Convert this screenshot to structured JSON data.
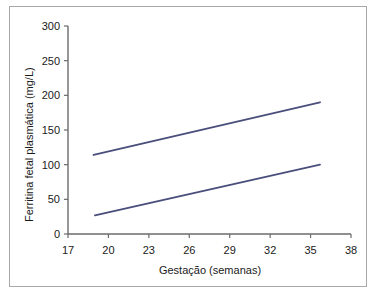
{
  "chart_data": {
    "type": "line",
    "title": "",
    "xlabel": "Gestação (semanas)",
    "ylabel": "Ferritina fetal plasmática (mg/L)",
    "xlim": [
      17,
      38
    ],
    "ylim": [
      0,
      300
    ],
    "xticks": [
      17,
      20,
      23,
      26,
      29,
      32,
      35,
      38
    ],
    "xtick_labels": [
      "17",
      "20",
      "23",
      "26",
      "29",
      "32",
      "35",
      "38"
    ],
    "yticks": [
      0,
      50,
      100,
      150,
      200,
      250,
      300
    ],
    "ytick_labels": [
      "0",
      "50",
      "100",
      "150",
      "200",
      "250",
      "300"
    ],
    "grid": false,
    "legend": false,
    "legend_position": "none",
    "line_color": "#4a4e7c",
    "axis_color": "#6b6b6b",
    "frame_color": "#a8a8a8",
    "background": "#ffffff",
    "series": [
      {
        "name": "upper",
        "x": [
          18.9,
          35.7
        ],
        "values": [
          114,
          190
        ]
      },
      {
        "name": "lower",
        "x": [
          19.0,
          35.7
        ],
        "values": [
          27,
          100
        ]
      }
    ]
  },
  "figure": {
    "width": 378,
    "height": 294
  }
}
